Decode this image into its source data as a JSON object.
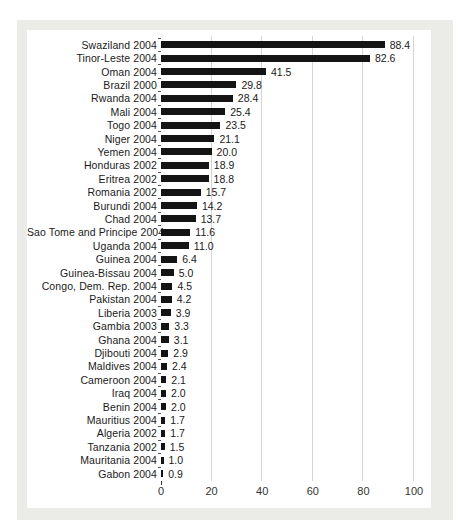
{
  "chart_data": {
    "type": "bar",
    "orientation": "horizontal",
    "title": "",
    "xlabel": "",
    "ylabel": "",
    "xlim": [
      0,
      100
    ],
    "x_ticks": [
      0,
      20,
      40,
      60,
      80,
      100
    ],
    "grid": "vertical-lines-at-x-ticks",
    "legend": "none",
    "categories": [
      "Swaziland 2004",
      "Tinor-Leste 2004",
      "Oman 2004",
      "Brazil 2000",
      "Rwanda 2004",
      "Mali 2004",
      "Togo 2004",
      "Niger 2004",
      "Yemen 2004",
      "Honduras 2002",
      "Eritrea 2002",
      "Romania 2002",
      "Burundi 2004",
      "Chad 2004",
      "Sao Tome and Principe 2004",
      "Uganda 2004",
      "Guinea 2004",
      "Guinea-Bissau 2004",
      "Congo, Dem. Rep. 2004",
      "Pakistan 2004",
      "Liberia 2003",
      "Gambia 2003",
      "Ghana 2004",
      "Djibouti 2004",
      "Maldives 2004",
      "Cameroon 2004",
      "Iraq 2004",
      "Benin 2004",
      "Mauritius 2004",
      "Algeria 2002",
      "Tanzania 2002",
      "Mauritania 2004",
      "Gabon 2004"
    ],
    "values": [
      88.4,
      82.6,
      41.5,
      29.8,
      28.4,
      25.4,
      23.5,
      21.1,
      20.0,
      18.9,
      18.8,
      15.7,
      14.2,
      13.7,
      11.6,
      11.0,
      6.4,
      5.0,
      4.5,
      4.2,
      3.9,
      3.3,
      3.1,
      2.9,
      2.4,
      2.1,
      2.0,
      2.0,
      1.7,
      1.7,
      1.5,
      1.0,
      0.9
    ],
    "value_labels": [
      "88.4",
      "82.6",
      "41.5",
      "29.8",
      "28.4",
      "25.4",
      "23.5",
      "21.1",
      "20.0",
      "18.9",
      "18.8",
      "15.7",
      "14.2",
      "13.7",
      "11.6",
      "11.0",
      "6.4",
      "5.0",
      "4.5",
      "4.2",
      "3.9",
      "3.3",
      "3.1",
      "2.9",
      "2.4",
      "2.1",
      "2.0",
      "2.0",
      "1.7",
      "1.7",
      "1.5",
      "1.0",
      "0.9"
    ]
  },
  "colors": {
    "page_bg": "#ffffff",
    "panel_bg": "#ebebe8",
    "chart_bg": "#ffffff",
    "bar": "#141414",
    "gridline": "#d4d4d2",
    "text": "#1a1a1a",
    "axis_text": "#333333"
  }
}
